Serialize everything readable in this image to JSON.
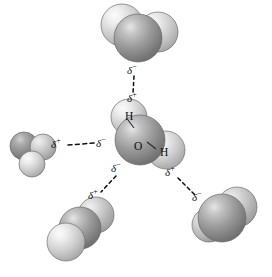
{
  "figure": {
    "name": "water-hydrogen-bonding-diagram",
    "background_color": "#ffffff",
    "width": 272,
    "height": 277,
    "colors": {
      "oxygen_dark": "#8a8a8a",
      "oxygen_highlight": "#d8d8d8",
      "hydrogen_light": "#c9c9c9",
      "hydrogen_highlight": "#f2f2f2",
      "outline": "#5a5a5a",
      "bond_line": "#111111",
      "text": "#111111"
    }
  },
  "central_molecule": {
    "name": "central-water-molecule",
    "atoms": [
      {
        "id": "h-top",
        "label": "H",
        "element": "hydrogen"
      },
      {
        "id": "o-center",
        "label": "O",
        "element": "oxygen"
      },
      {
        "id": "h-right",
        "label": "H",
        "element": "hydrogen"
      }
    ],
    "bond_labels": {
      "oh_top": "H",
      "oxygen": "O",
      "oh_right": "H"
    }
  },
  "neighbor_molecules": [
    {
      "id": "top",
      "name": "top-water-molecule",
      "element_counts": {
        "oxygen": 1,
        "hydrogen": 2
      }
    },
    {
      "id": "left",
      "name": "left-water-molecule",
      "element_counts": {
        "oxygen": 1,
        "hydrogen": 2
      }
    },
    {
      "id": "bottom-left",
      "name": "bottom-left-water-molecule",
      "element_counts": {
        "oxygen": 1,
        "hydrogen": 2
      }
    },
    {
      "id": "bottom-right",
      "name": "bottom-right-water-molecule",
      "element_counts": {
        "oxygen": 1,
        "hydrogen": 2
      }
    }
  ],
  "hydrogen_bonds": [
    {
      "id": "bond-top",
      "name": "hydrogen-bond-top",
      "from_label": {
        "symbol": "δ",
        "sign": "−",
        "full": "δ−"
      },
      "to_label": {
        "symbol": "δ",
        "sign": "+",
        "full": "δ+"
      },
      "style": "dashed"
    },
    {
      "id": "bond-left",
      "name": "hydrogen-bond-left",
      "from_label": {
        "symbol": "δ",
        "sign": "+",
        "full": "δ+"
      },
      "to_label": {
        "symbol": "δ",
        "sign": "−",
        "full": "δ−"
      },
      "style": "dashed"
    },
    {
      "id": "bond-bottom-left",
      "name": "hydrogen-bond-bottom-left",
      "from_label": {
        "symbol": "δ",
        "sign": "−",
        "full": "δ−"
      },
      "to_label": {
        "symbol": "δ",
        "sign": "+",
        "full": "δ+"
      },
      "style": "dashed"
    },
    {
      "id": "bond-bottom-right",
      "name": "hydrogen-bond-bottom-right",
      "from_label": {
        "symbol": "δ",
        "sign": "+",
        "full": "δ+"
      },
      "to_label": {
        "symbol": "δ",
        "sign": "−",
        "full": "δ−"
      },
      "style": "dashed"
    }
  ],
  "charge_labels": {
    "top_upper": {
      "text": "δ",
      "sign": "−"
    },
    "top_lower": {
      "text": "δ",
      "sign": "+"
    },
    "left_outer": {
      "text": "δ",
      "sign": "+"
    },
    "left_inner": {
      "text": "δ",
      "sign": "−"
    },
    "bottom_left_inner": {
      "text": "δ",
      "sign": "−"
    },
    "bottom_left_outer": {
      "text": "δ",
      "sign": "+"
    },
    "bottom_right_inner": {
      "text": "δ",
      "sign": "+"
    },
    "bottom_right_outer": {
      "text": "δ",
      "sign": "−"
    }
  }
}
